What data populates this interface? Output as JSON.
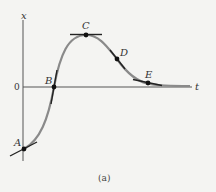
{
  "diagram": {
    "axes": {
      "y_label": "x",
      "x_label": "t",
      "origin_label": "0"
    },
    "caption": "(a)",
    "points": [
      {
        "id": "A",
        "label": "A",
        "tangent": "positive-slope"
      },
      {
        "id": "B",
        "label": "B",
        "tangent": "steep-positive"
      },
      {
        "id": "C",
        "label": "C",
        "tangent": "horizontal"
      },
      {
        "id": "D",
        "label": "D",
        "tangent": "negative-slope"
      },
      {
        "id": "E",
        "label": "E",
        "tangent": "slight-negative"
      }
    ],
    "colors": {
      "curve": "#8a8a8a",
      "axis": "#555555",
      "point": "#111111",
      "tangent": "#222222",
      "background": "#f4f4f2"
    }
  }
}
